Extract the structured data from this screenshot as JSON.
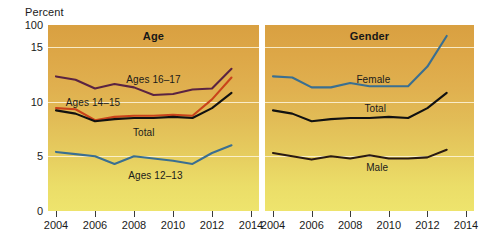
{
  "axis": {
    "y_title": "Percent",
    "y_ticks": [
      "100",
      "15",
      "10",
      "5",
      "0"
    ],
    "x_ticks_left": [
      "2004",
      "2006",
      "2008",
      "2010",
      "2012",
      "2014"
    ],
    "x_ticks_right": [
      "2004",
      "2006",
      "2008",
      "2010",
      "2012",
      "2014"
    ],
    "break_symbol": "axis-break"
  },
  "panels": {
    "age": {
      "title": "Age"
    },
    "gender": {
      "title": "Gender"
    }
  },
  "colors": {
    "ages_16_17": "#5a2342",
    "ages_14_15": "#c9431b",
    "total": "#111111",
    "ages_12_13": "#3a6f91",
    "female": "#3a6f91",
    "male": "#2a1a12",
    "background_top": "#d9a041",
    "background_bottom": "#eee46d",
    "gridline": "#fdf6dd"
  },
  "chart_data": {
    "type": "line",
    "title": "",
    "xlabel": "",
    "ylabel": "Percent",
    "xlim": [
      2004,
      2014
    ],
    "ylim": [
      0,
      17
    ],
    "yticks": [
      0,
      5,
      10,
      15
    ],
    "ytick_labels": [
      "0",
      "5",
      "10",
      "15"
    ],
    "axis_break_above": 15,
    "axis_top_label": "100",
    "grid": true,
    "legend": "inline-annotations",
    "panels": [
      {
        "name": "Age",
        "x": [
          2004,
          2005,
          2006,
          2007,
          2008,
          2009,
          2010,
          2011,
          2012,
          2013
        ],
        "series": [
          {
            "name": "Ages 16-17",
            "label": "Ages 16–17",
            "color": "#5a2342",
            "values": [
              12.3,
              12.0,
              11.2,
              11.6,
              11.3,
              10.6,
              10.7,
              11.1,
              11.2,
              13.0
            ]
          },
          {
            "name": "Ages 14-15",
            "label": "Ages 14–15",
            "color": "#c9431b",
            "values": [
              9.4,
              9.3,
              8.3,
              8.6,
              8.7,
              8.7,
              8.8,
              8.7,
              10.2,
              12.2
            ]
          },
          {
            "name": "Total",
            "label": "Total",
            "color": "#111111",
            "values": [
              9.2,
              8.9,
              8.2,
              8.4,
              8.5,
              8.5,
              8.6,
              8.5,
              9.4,
              10.8
            ]
          },
          {
            "name": "Ages 12-13",
            "label": "Ages 12–13",
            "color": "#3a6f91",
            "values": [
              5.4,
              5.2,
              5.0,
              4.3,
              5.0,
              4.8,
              4.6,
              4.3,
              5.3,
              6.0
            ]
          }
        ]
      },
      {
        "name": "Gender",
        "x": [
          2004,
          2005,
          2006,
          2007,
          2008,
          2009,
          2010,
          2011,
          2012,
          2013
        ],
        "series": [
          {
            "name": "Female",
            "label": "Female",
            "color": "#3a6f91",
            "values": [
              12.3,
              12.2,
              11.3,
              11.3,
              11.7,
              11.4,
              11.4,
              11.4,
              13.2,
              16.0
            ]
          },
          {
            "name": "Total",
            "label": "Total",
            "color": "#111111",
            "values": [
              9.2,
              8.9,
              8.2,
              8.4,
              8.5,
              8.5,
              8.6,
              8.5,
              9.4,
              10.8
            ]
          },
          {
            "name": "Male",
            "label": "Male",
            "color": "#2a1a12",
            "values": [
              5.3,
              5.0,
              4.7,
              5.0,
              4.8,
              5.1,
              4.8,
              4.8,
              4.9,
              5.6
            ]
          }
        ]
      }
    ],
    "annotations": [
      {
        "text": "Ages 16–17",
        "panel": "Age",
        "x": 2009.0,
        "y": 12.1
      },
      {
        "text": "Ages 14–15",
        "panel": "Age",
        "x": 2005.9,
        "y": 10.0
      },
      {
        "text": "Total",
        "panel": "Age",
        "x": 2008.5,
        "y": 7.2
      },
      {
        "text": "Ages 12–13",
        "panel": "Age",
        "x": 2009.1,
        "y": 3.3
      },
      {
        "text": "Female",
        "panel": "Gender",
        "x": 2009.2,
        "y": 12.1
      },
      {
        "text": "Total",
        "panel": "Gender",
        "x": 2009.3,
        "y": 9.4
      },
      {
        "text": "Male",
        "panel": "Gender",
        "x": 2009.4,
        "y": 4.0
      }
    ]
  }
}
